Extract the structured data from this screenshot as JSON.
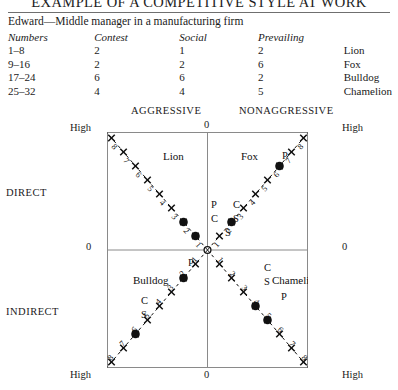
{
  "header": {
    "title": "EXAMPLE OF A COMPETITIVE STYLE AT WORK",
    "subtitle": "Edward—Middle manager in a manufacturing firm"
  },
  "table": {
    "columns": [
      "Numbers",
      "Contest",
      "Social",
      "Prevailing",
      ""
    ],
    "rows": [
      {
        "numbers": "1–8",
        "contest": "2",
        "social": "1",
        "prevailing": "2",
        "style": "Lion"
      },
      {
        "numbers": "9–16",
        "contest": "2",
        "social": "2",
        "prevailing": "6",
        "style": "Fox"
      },
      {
        "numbers": "17–24",
        "contest": "6",
        "social": "6",
        "prevailing": "2",
        "style": "Bulldog"
      },
      {
        "numbers": "25–32",
        "contest": "4",
        "social": "4",
        "prevailing": "5",
        "style": "Chamelion"
      }
    ]
  },
  "axes": {
    "top_left_caption": "AGGRESSIVE",
    "top_right_caption": "NONAGGRESSIVE",
    "left_upper_caption": "DIRECT",
    "left_lower_caption": "INDIRECT",
    "left_top": "High",
    "left_mid": "0",
    "left_bottom": "High",
    "right_top": "High",
    "right_mid": "0",
    "right_bottom": "High",
    "top_mid": "0",
    "bottom_mid": "0"
  },
  "chart_data": {
    "type": "scatter",
    "title": "EXAMPLE OF A COMPETITIVE STYLE AT WORK",
    "xlabel": "",
    "ylabel": "",
    "grid": false,
    "legend_position": "none",
    "scale_ticks": [
      1,
      2,
      3,
      4,
      5,
      6,
      7,
      8
    ],
    "quadrants": [
      {
        "name": "Lion",
        "position": "upper-left",
        "axis_direction": "up-left",
        "label_x": 56,
        "label_y": 28,
        "markers": [
          {
            "label": "P",
            "value": 2,
            "shown_as_letter": true,
            "letter_x": 104,
            "letter_y": 76
          },
          {
            "label": "C",
            "value": 2,
            "shown_as_letter": true,
            "letter_x": 104,
            "letter_y": 90
          },
          {
            "label": "S",
            "value": 1,
            "shown_as_letter": true,
            "letter_x": 118,
            "letter_y": 104
          },
          {
            "label": "dot-a",
            "value": 2,
            "shown_as_letter": false
          },
          {
            "label": "dot-b",
            "value": 1,
            "shown_as_letter": false
          }
        ]
      },
      {
        "name": "Fox",
        "position": "upper-right",
        "axis_direction": "up-right",
        "label_x": 134,
        "label_y": 28,
        "markers": [
          {
            "label": "C",
            "value": 2,
            "shown_as_letter": true,
            "letter_x": 126,
            "letter_y": 76
          },
          {
            "label": "S",
            "value": 2,
            "shown_as_letter": true,
            "letter_x": 126,
            "letter_y": 90
          },
          {
            "label": "P",
            "value": 6,
            "shown_as_letter": true,
            "letter_x": 175,
            "letter_y": 27
          },
          {
            "label": "dot-a",
            "value": 2,
            "shown_as_letter": false
          },
          {
            "label": "dot-b",
            "value": 6,
            "shown_as_letter": false
          }
        ]
      },
      {
        "name": "Bulldog",
        "position": "lower-left",
        "axis_direction": "down-left",
        "label_x": 26,
        "label_y": 152,
        "markers": [
          {
            "label": "C",
            "value": 6,
            "shown_as_letter": true,
            "letter_x": 34,
            "letter_y": 172
          },
          {
            "label": "S",
            "value": 6,
            "shown_as_letter": true,
            "letter_x": 34,
            "letter_y": 186
          },
          {
            "label": "P",
            "value": 2,
            "shown_as_letter": true,
            "letter_x": 81,
            "letter_y": 134
          },
          {
            "label": "dot-a",
            "value": 2,
            "shown_as_letter": false
          },
          {
            "label": "dot-b",
            "value": 6,
            "shown_as_letter": false
          }
        ]
      },
      {
        "name": "Chamelion",
        "position": "lower-right",
        "axis_direction": "down-right",
        "label_x": 165,
        "label_y": 152,
        "markers": [
          {
            "label": "C",
            "value": 4,
            "shown_as_letter": true,
            "letter_x": 157,
            "letter_y": 139
          },
          {
            "label": "S",
            "value": 4,
            "shown_as_letter": true,
            "letter_x": 157,
            "letter_y": 153
          },
          {
            "label": "P",
            "value": 5,
            "shown_as_letter": true,
            "letter_x": 174,
            "letter_y": 168
          },
          {
            "label": "dot-a",
            "value": 4,
            "shown_as_letter": false
          },
          {
            "label": "dot-b",
            "value": 5,
            "shown_as_letter": false
          }
        ]
      }
    ]
  }
}
